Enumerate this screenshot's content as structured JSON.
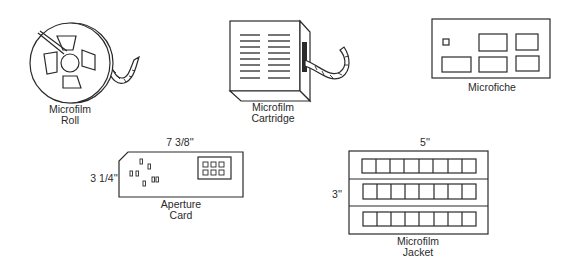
{
  "diagram": {
    "items": [
      {
        "id": "roll",
        "label_line1": "Microfilm",
        "label_line2": "Roll"
      },
      {
        "id": "cartridge",
        "label_line1": "Microfilm",
        "label_line2": "Cartridge"
      },
      {
        "id": "microfiche",
        "label_line1": "Microfiche"
      },
      {
        "id": "aperture-card",
        "label_line1": "Aperture",
        "label_line2": "Card",
        "width_dim": "7 3/8''",
        "height_dim": "3 1/4''"
      },
      {
        "id": "jacket",
        "label_line1": "Microfilm",
        "label_line2": "Jacket",
        "width_dim": "5''",
        "height_dim": "3''",
        "rows": 3,
        "frames_per_row": 8
      }
    ]
  }
}
